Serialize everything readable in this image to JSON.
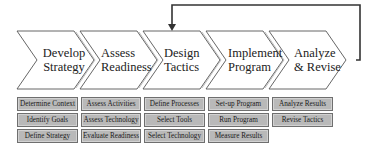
{
  "stages": [
    {
      "label_line1": "Develop",
      "label_line2": "Strategy",
      "tasks": [
        "Determine Context",
        "Identify Goals",
        "Define Strategy"
      ]
    },
    {
      "label_line1": "Assess",
      "label_line2": "Readiness",
      "tasks": [
        "Assess Activities",
        "Assess Technology",
        "Evaluate Readiness"
      ]
    },
    {
      "label_line1": "Design",
      "label_line2": "Tactics",
      "tasks": [
        "Define Processes",
        "Select Tools",
        "Select Technology"
      ]
    },
    {
      "label_line1": "Implement",
      "label_line2": "Program",
      "tasks": [
        "Set-up Program",
        "Run Program",
        "Measure Results"
      ]
    },
    {
      "label_line1": "Analyze",
      "label_line2": "& Revise",
      "tasks": [
        "Analyze Results",
        "Revise Tactics"
      ]
    }
  ],
  "feedback_arrow": {
    "from": "Analyze & Revise",
    "to": "Design Tactics"
  },
  "colors": {
    "task_fill": "#b9b9b9",
    "task_border": "#6f6f6f",
    "line": "#333333"
  }
}
